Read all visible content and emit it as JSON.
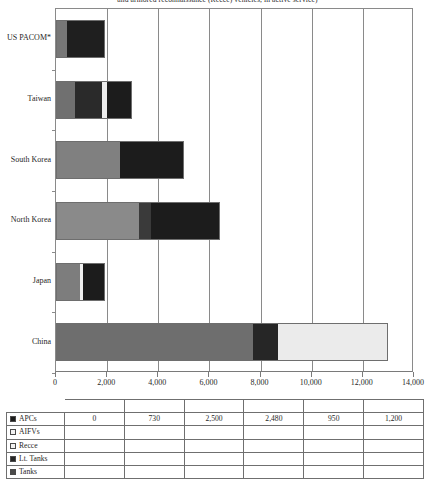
{
  "chart_data": {
    "type": "bar",
    "orientation": "horizontal",
    "stacked": true,
    "title": "and armored reconnaissance (Recce) vehicles, in active service)",
    "xlabel": "",
    "ylabel": "",
    "xlim": [
      0,
      14000
    ],
    "xticks": [
      0,
      2000,
      4000,
      6000,
      8000,
      10000,
      12000,
      14000
    ],
    "xticklabels": [
      "0",
      "2,000",
      "4,000",
      "6,000",
      "8,000",
      "10,000",
      "12,000",
      "14,000"
    ],
    "grid": "vertical",
    "legend_position": "bottom-table",
    "categories": [
      "US PACOM*",
      "Taiwan",
      "South Korea",
      "North Korea",
      "Japan",
      "China"
    ],
    "series": [
      {
        "name": "APCs",
        "color": "#1c1c1c",
        "values": [
          0,
          730,
          2500,
          2480,
          950,
          1200
        ]
      },
      {
        "name": "AIFVs",
        "color": "#f0f0f0",
        "values": [
          null,
          null,
          null,
          null,
          null,
          null
        ]
      },
      {
        "name": "Recce",
        "color": "#efefef",
        "values": [
          null,
          null,
          null,
          null,
          null,
          null
        ]
      },
      {
        "name": "Lt. Tanks",
        "color": "#262626",
        "values": [
          null,
          null,
          null,
          null,
          null,
          null
        ]
      },
      {
        "name": "Tanks",
        "color": "#4f4f4f",
        "values": [
          null,
          null,
          null,
          null,
          null,
          null
        ]
      }
    ],
    "bars": [
      {
        "category": "US PACOM*",
        "total": 1900,
        "segments": [
          {
            "series": "Tanks",
            "start": 0,
            "end": 400,
            "value": 400,
            "color": "#777777"
          },
          {
            "series": "APCs",
            "start": 400,
            "end": 1900,
            "value": 1500,
            "color": "#1f1f1f"
          }
        ]
      },
      {
        "category": "Taiwan",
        "total": 2980,
        "segments": [
          {
            "series": "Tanks",
            "start": 0,
            "end": 730,
            "value": 730,
            "color": "#707070"
          },
          {
            "series": "Lt. Tanks",
            "start": 730,
            "end": 1800,
            "value": 1070,
            "color": "#2a2a2a"
          },
          {
            "series": "Recce",
            "start": 1800,
            "end": 1990,
            "value": 190,
            "color": "#ededed"
          },
          {
            "series": "APCs",
            "start": 1990,
            "end": 2980,
            "value": 990,
            "color": "#1c1c1c"
          }
        ]
      },
      {
        "category": "South Korea",
        "total": 5000,
        "segments": [
          {
            "series": "Tanks",
            "start": 0,
            "end": 2500,
            "value": 2500,
            "color": "#808080"
          },
          {
            "series": "APCs",
            "start": 2500,
            "end": 5000,
            "value": 2500,
            "color": "#1c1c1c"
          }
        ]
      },
      {
        "category": "North Korea",
        "total": 6400,
        "segments": [
          {
            "series": "Tanks",
            "start": 0,
            "end": 3230,
            "value": 3230,
            "color": "#8a8a8a"
          },
          {
            "series": "Lt. Tanks",
            "start": 3230,
            "end": 3720,
            "value": 490,
            "color": "#3a3a3a"
          },
          {
            "series": "APCs",
            "start": 3720,
            "end": 6400,
            "value": 2680,
            "color": "#1c1c1c"
          }
        ]
      },
      {
        "category": "Japan",
        "total": 1920,
        "segments": [
          {
            "series": "Tanks",
            "start": 0,
            "end": 950,
            "value": 950,
            "color": "#7d7d7d"
          },
          {
            "series": "Recce",
            "start": 950,
            "end": 1060,
            "value": 110,
            "color": "#f0f0f0"
          },
          {
            "series": "APCs",
            "start": 1060,
            "end": 1920,
            "value": 860,
            "color": "#1c1c1c"
          }
        ]
      },
      {
        "category": "China",
        "total": 13000,
        "segments": [
          {
            "series": "Tanks",
            "start": 0,
            "end": 7700,
            "value": 7700,
            "color": "#6e6e6e"
          },
          {
            "series": "Lt. Tanks",
            "start": 7700,
            "end": 8700,
            "value": 1000,
            "color": "#262626"
          },
          {
            "series": "AIFVs",
            "start": 8700,
            "end": 13000,
            "value": 4300,
            "color": "#ebebeb"
          }
        ]
      }
    ]
  },
  "legend_table": {
    "spacer_row_cells": 6,
    "rows": [
      {
        "label": "APCs",
        "swatch": "#1c1c1c",
        "values": [
          "0",
          "730",
          "2,500",
          "2,480",
          "950",
          "1,200"
        ]
      },
      {
        "label": "AIFVs",
        "swatch": "#f2f2f2",
        "values": [
          "",
          "",
          "",
          "",
          "",
          ""
        ]
      },
      {
        "label": "Recce",
        "swatch": "#f2f2f2",
        "values": [
          "",
          "",
          "",
          "",
          "",
          ""
        ]
      },
      {
        "label": "Lt. Tanks",
        "swatch": "#262626",
        "values": [
          "",
          "",
          "",
          "",
          "",
          ""
        ]
      },
      {
        "label": "Tanks",
        "swatch": "#4a4a4a",
        "values": [
          "",
          "",
          "",
          "",
          "",
          ""
        ]
      }
    ]
  }
}
